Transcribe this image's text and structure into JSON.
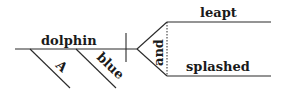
{
  "diagram": {
    "type": "sentence-diagram",
    "subject": {
      "word": "dolphin",
      "modifiers": [
        "A",
        "blue"
      ]
    },
    "conjunction": "and",
    "predicates": [
      "leapt",
      "splashed"
    ],
    "colors": {
      "line": "#2a2a2a",
      "text": "#1a1a1a",
      "background": "#ffffff"
    }
  }
}
